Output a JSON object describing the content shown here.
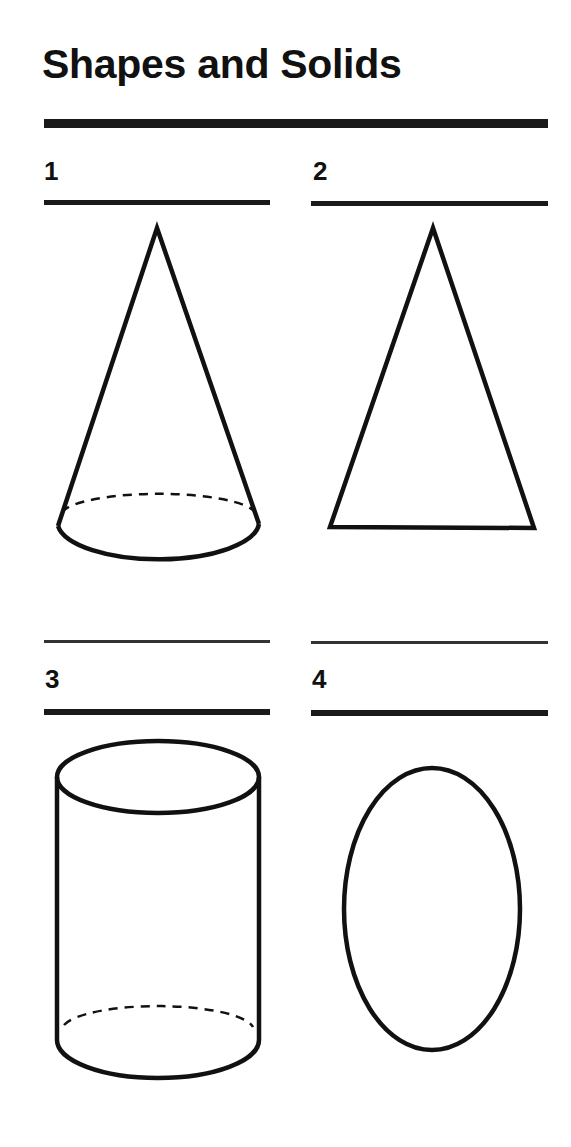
{
  "page": {
    "title": "Shapes and Solids"
  },
  "items": [
    {
      "number": "1",
      "shape": "cone",
      "answer": ""
    },
    {
      "number": "2",
      "shape": "triangle",
      "answer": ""
    },
    {
      "number": "3",
      "shape": "cylinder",
      "answer": ""
    },
    {
      "number": "4",
      "shape": "ellipse",
      "answer": ""
    }
  ],
  "colors": {
    "ink": "#111111",
    "background": "#ffffff"
  }
}
